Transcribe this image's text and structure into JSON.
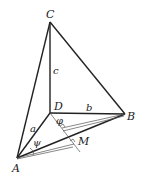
{
  "diagram": {
    "type": "tetrahedron",
    "vertices": {
      "C": {
        "label": "C",
        "x": 50,
        "y": 22
      },
      "D": {
        "label": "D",
        "x": 50,
        "y": 113
      },
      "B": {
        "label": "B",
        "x": 125,
        "y": 114
      },
      "A": {
        "label": "A",
        "x": 17,
        "y": 158
      },
      "M": {
        "label": "M"
      }
    },
    "edges": {
      "c": "c",
      "b": "b",
      "a": "a"
    },
    "angles": {
      "phi": "φ",
      "psi": "ψ"
    },
    "colors": {
      "stroke": "#222222",
      "thin": "#666666"
    }
  }
}
